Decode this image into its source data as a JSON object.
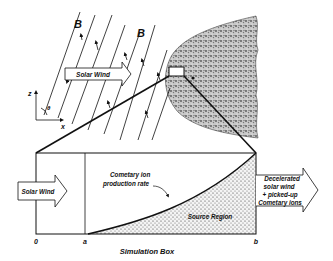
{
  "figure": {
    "upper": {
      "field_label_1": "B",
      "field_label_2": "B",
      "solar_wind_arrow": "Solar Wind",
      "axis_z": "z",
      "axis_x": "x",
      "angle": "θ"
    },
    "lower": {
      "solar_wind_in": "Solar Wind",
      "curve_label_line1": "Cometary ion",
      "curve_label_line2": "production rate",
      "source_region": "Source Region",
      "outflow_line1": "Decelerated",
      "outflow_line2": "solar wind",
      "outflow_line3": "+ picked-up",
      "outflow_line4": "Cometary ions",
      "tick_0": "0",
      "tick_a": "a",
      "tick_b": "b",
      "caption": "Simulation Box"
    },
    "colors": {
      "ink": "#111111",
      "stipple_bg": "#f2f2f2",
      "coma_bg": "#bdbdbd"
    }
  }
}
